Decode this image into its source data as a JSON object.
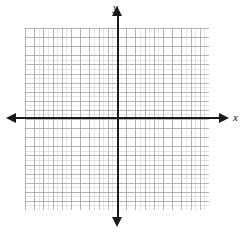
{
  "figure": {
    "type": "coordinate-plane",
    "background_color": "#ffffff",
    "axis_color": "#1a1a1a",
    "grid_major_color": "#8c8c8c",
    "grid_minor_color": "#aaaaaa"
  },
  "axes": {
    "x": {
      "label": "x",
      "label_style": "italic",
      "arrow_start": "left",
      "arrow_end": "right"
    },
    "y": {
      "label": "y",
      "label_style": "italic",
      "arrow_start": "down",
      "arrow_end": "up"
    }
  },
  "grid": {
    "major_cell_px": 9.2,
    "minor_cell_px": 4.6,
    "columns_major": 20,
    "rows_major": 20,
    "visible": true,
    "tick_labels": []
  },
  "chart_data": {
    "type": "scatter",
    "title": "",
    "xlabel": "x",
    "ylabel": "y",
    "x": [],
    "y": [],
    "series": [],
    "xlim": [
      -10,
      10
    ],
    "ylim": [
      -10,
      10
    ],
    "xticks": [],
    "yticks": [],
    "grid": true,
    "legend": null,
    "annotations": []
  }
}
